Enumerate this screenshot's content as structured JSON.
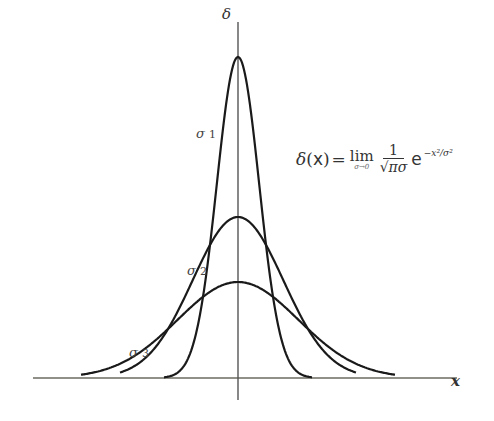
{
  "chart_data": {
    "type": "line",
    "title": "",
    "xlabel": "x",
    "ylabel": "δ",
    "grid": false,
    "legend": null,
    "formula": {
      "lhs": "δ(x)",
      "equals": "=",
      "lim": "lim",
      "lim_sub": "σ→0",
      "numerator": "1",
      "denominator": "√πσ",
      "exp_base": "e",
      "exponent": "−x²/σ²"
    },
    "series": [
      {
        "name": "σ 1",
        "label": "σ",
        "index": "1",
        "sigma": 0.35,
        "peak_px": 57,
        "description": "narrowest, tallest Gaussian"
      },
      {
        "name": "σ 2",
        "label": "σ",
        "index": "2",
        "sigma": 1.0,
        "peak_px": 217,
        "description": "medium Gaussian"
      },
      {
        "name": "σ 3",
        "label": "σ",
        "index": "3",
        "sigma": 1.6,
        "peak_px": 282,
        "description": "widest, lowest Gaussian"
      }
    ],
    "annotations": [
      "σ 1",
      "σ 2",
      "σ 3",
      "δ(x) = lim_{σ→0} 1/(√π σ) e^{−x²/σ²}"
    ]
  },
  "labels": {
    "y_axis": "δ",
    "x_axis": "x",
    "sigma": "σ",
    "s1": "1",
    "s2": "2",
    "s3": "3"
  },
  "colors": {
    "curve": "#1a1a1a",
    "axis": "#555555",
    "text": "#333333"
  }
}
